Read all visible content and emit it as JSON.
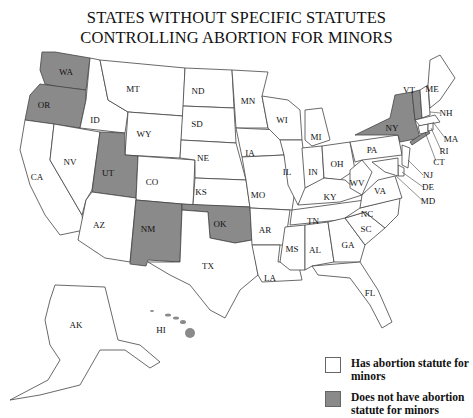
{
  "title": {
    "line1": "STATES WITHOUT SPECIFIC STATUTES",
    "line2": "CONTROLLING ABORTION FOR MINORS"
  },
  "legend": {
    "has_statute": {
      "label": "Has abortion statute for minors",
      "color": "#ffffff"
    },
    "no_statute": {
      "label": "Does not have abortion statute for minors",
      "color": "#8a8a8a"
    }
  },
  "states_without_statute": [
    "WA",
    "OR",
    "UT",
    "NM",
    "OK",
    "NY",
    "VT",
    "HI"
  ],
  "state_labels": {
    "WA": "WA",
    "OR": "OR",
    "CA": "CA",
    "ID": "ID",
    "NV": "NV",
    "MT": "MT",
    "WY": "WY",
    "UT": "UT",
    "AZ": "AZ",
    "CO": "CO",
    "NM": "NM",
    "ND": "ND",
    "SD": "SD",
    "NE": "NE",
    "KS": "KS",
    "OK": "OK",
    "TX": "TX",
    "MN": "MN",
    "IA": "IA",
    "MO": "MO",
    "AR": "AR",
    "LA": "LA",
    "WI": "WI",
    "IL": "IL",
    "MI": "MI",
    "IN": "IN",
    "OH": "OH",
    "KY": "KY",
    "TN": "TN",
    "MS": "MS",
    "AL": "AL",
    "GA": "GA",
    "FL": "FL",
    "SC": "SC",
    "NC": "NC",
    "VA": "VA",
    "WV": "WV",
    "PA": "PA",
    "NY": "NY",
    "VT": "VT",
    "NH": "NH",
    "ME": "ME",
    "MA": "MA",
    "RI": "RI",
    "CT": "CT",
    "NJ": "NJ",
    "DE": "DE",
    "MD": "MD",
    "AK": "AK",
    "HI": "HI"
  }
}
